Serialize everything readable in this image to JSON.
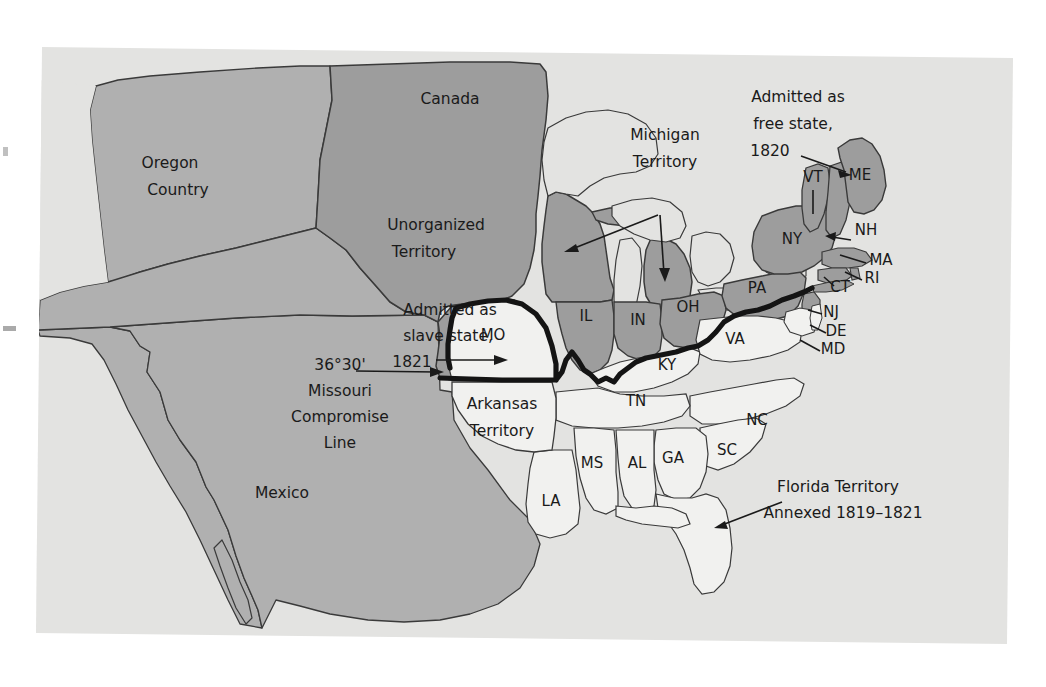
{
  "figure": {
    "kind": "historical-map",
    "background_color": "#ffffff",
    "panel_color": "#e3e3e1"
  },
  "palette": {
    "free_state": "#9d9d9d",
    "slave_state": "#f1f1ef",
    "territory_unorganized": "#9d9d9d",
    "territory_light": "#b0b0b0",
    "ocean": "#e3e3e1",
    "outline": "#3a3a3a",
    "compromise_line": "#141414",
    "text": "#1a1a1a"
  },
  "regions": {
    "canada": "Canada",
    "mexico": "Mexico",
    "oregon_country": "Oregon\nCountry",
    "oregon_country_l1": "Oregon",
    "oregon_country_l2": "Country",
    "unorganized_l1": "Unorganized",
    "unorganized_l2": "Territory",
    "michigan_l1": "Michigan",
    "michigan_l2": "Territory",
    "arkansas_l1": "Arkansas",
    "arkansas_l2": "Territory"
  },
  "annotations": {
    "free_state_l1": "Admitted as",
    "free_state_l2": "free state,",
    "free_state_l3": "1820",
    "slave_state_l1": "Admitted as",
    "slave_state_l2": "slave state,",
    "slave_state_l3": "1821",
    "compromise_l1": "36°30'",
    "compromise_l2": "Missouri",
    "compromise_l3": "Compromise",
    "compromise_l4": "Line",
    "florida_l1": "Florida Territory",
    "florida_l2": "Annexed 1819–1821"
  },
  "states": {
    "free": [
      {
        "abbr": "IL",
        "x": 586,
        "y": 321
      },
      {
        "abbr": "IN",
        "x": 638,
        "y": 325
      },
      {
        "abbr": "OH",
        "x": 688,
        "y": 312
      },
      {
        "abbr": "PA",
        "x": 757,
        "y": 293
      },
      {
        "abbr": "NY",
        "x": 792,
        "y": 244
      },
      {
        "abbr": "VT",
        "x": 813,
        "y": 182
      },
      {
        "abbr": "ME",
        "x": 860,
        "y": 180
      },
      {
        "abbr": "NH",
        "x": 866,
        "y": 235
      },
      {
        "abbr": "MA",
        "x": 881,
        "y": 265
      },
      {
        "abbr": "RI",
        "x": 872,
        "y": 283
      },
      {
        "abbr": "CT",
        "x": 840,
        "y": 292
      },
      {
        "abbr": "NJ",
        "x": 831,
        "y": 317
      }
    ],
    "slave": [
      {
        "abbr": "MO",
        "x": 493,
        "y": 340
      },
      {
        "abbr": "KY",
        "x": 667,
        "y": 370
      },
      {
        "abbr": "VA",
        "x": 735,
        "y": 344
      },
      {
        "abbr": "DE",
        "x": 836,
        "y": 336
      },
      {
        "abbr": "MD",
        "x": 833,
        "y": 354
      },
      {
        "abbr": "NC",
        "x": 757,
        "y": 425
      },
      {
        "abbr": "TN",
        "x": 636,
        "y": 406
      },
      {
        "abbr": "SC",
        "x": 727,
        "y": 455
      },
      {
        "abbr": "GA",
        "x": 673,
        "y": 463
      },
      {
        "abbr": "AL",
        "x": 637,
        "y": 468
      },
      {
        "abbr": "MS",
        "x": 592,
        "y": 468
      },
      {
        "abbr": "LA",
        "x": 551,
        "y": 506
      }
    ]
  },
  "legend_meaning": {
    "dark_gray": "Free states and unorganized territory",
    "light": "Slave states and territories"
  }
}
